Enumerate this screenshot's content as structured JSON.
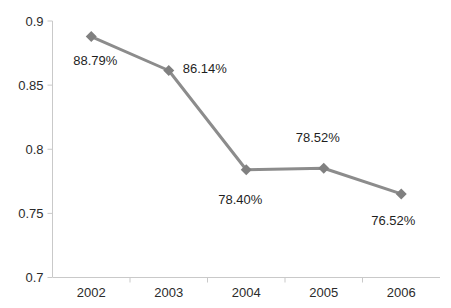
{
  "chart_data": {
    "type": "line",
    "title": "",
    "subtitle": "",
    "xlabel": "",
    "ylabel": "",
    "categories": [
      "2002",
      "2003",
      "2004",
      "2005",
      "2006"
    ],
    "values": [
      0.8879,
      0.8614,
      0.784,
      0.7852,
      0.7652
    ],
    "point_labels": [
      "88.79%",
      "86.14%",
      "78.40%",
      "78.52%",
      "76.52%"
    ],
    "ylim": [
      0.7,
      0.9
    ],
    "ytick_labels": [
      "0.9",
      "0.85",
      "0.8",
      "0.75",
      "0.7"
    ],
    "ytick_values": [
      0.9,
      0.85,
      0.8,
      0.75,
      0.7
    ],
    "grid": false,
    "legend": false,
    "legend_position": "none",
    "series": [
      {
        "name": "",
        "values": [
          0.8879,
          0.8614,
          0.784,
          0.7852,
          0.7652
        ],
        "line_color": "#8c8c8c",
        "marker": "diamond",
        "marker_color": "#808080"
      }
    ],
    "colors": {
      "line": "#8c8c8c",
      "marker": "#808080",
      "axis": "#c9c9c9",
      "text": "#1f1f1f",
      "background": "#ffffff"
    }
  }
}
